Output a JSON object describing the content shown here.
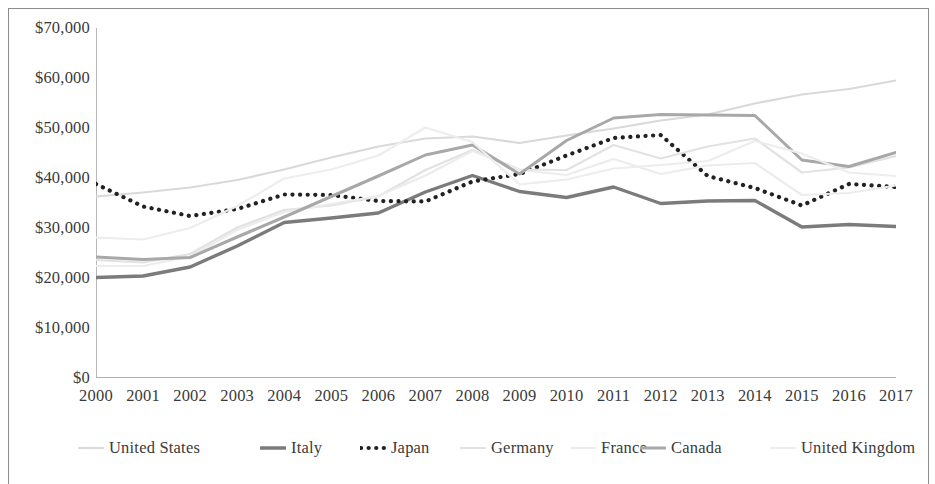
{
  "chart_data": {
    "type": "line",
    "title": "",
    "subtitle": "",
    "xlabel": "",
    "ylabel": "",
    "grid": false,
    "legend_position": "bottom",
    "x": [
      2000,
      2001,
      2002,
      2003,
      2004,
      2005,
      2006,
      2007,
      2008,
      2009,
      2010,
      2011,
      2012,
      2013,
      2014,
      2015,
      2016,
      2017
    ],
    "categories": [
      "2000",
      "2001",
      "2002",
      "2003",
      "2004",
      "2005",
      "2006",
      "2007",
      "2008",
      "2009",
      "2010",
      "2011",
      "2012",
      "2013",
      "2014",
      "2015",
      "2016",
      "2017"
    ],
    "xlim": [
      2000,
      2017
    ],
    "ylim": [
      0,
      70000
    ],
    "ytick_values": [
      0,
      10000,
      20000,
      30000,
      40000,
      50000,
      60000,
      70000
    ],
    "ytick_labels": [
      "$0",
      "$10,000",
      "$20,000",
      "$30,000",
      "$40,000",
      "$50,000",
      "$60,000",
      "$70,000"
    ],
    "series": [
      {
        "name": "United States",
        "color": "#d9d9d9",
        "style": "solid",
        "width": 2.2,
        "values": [
          36300,
          37100,
          38100,
          39600,
          41700,
          44100,
          46300,
          47900,
          48300,
          47000,
          48500,
          49900,
          51500,
          52700,
          54900,
          56700,
          57800,
          59500
        ]
      },
      {
        "name": "Italy",
        "color": "#7b7b7b",
        "style": "solid",
        "width": 3.4,
        "values": [
          20100,
          20400,
          22200,
          26400,
          31100,
          32000,
          33000,
          37200,
          40500,
          37300,
          36100,
          38200,
          34900,
          35400,
          35500,
          30200,
          30700,
          30300
        ]
      },
      {
        "name": "Japan",
        "color": "#222222",
        "style": "dotted",
        "width": 4.2,
        "values": [
          38800,
          34300,
          32400,
          33800,
          36700,
          36600,
          35400,
          35300,
          39300,
          40800,
          44500,
          48000,
          48600,
          40400,
          38000,
          34500,
          38800,
          38200
        ]
      },
      {
        "name": "Germany",
        "color": "#e2e2e2",
        "style": "solid",
        "width": 2.2,
        "values": [
          23600,
          23100,
          24800,
          30100,
          33600,
          34500,
          36300,
          41600,
          45600,
          41700,
          41600,
          46600,
          43900,
          46300,
          47900,
          41100,
          42100,
          44400
        ]
      },
      {
        "name": "France",
        "color": "#ececec",
        "style": "solid",
        "width": 2.2,
        "values": [
          22400,
          22400,
          24300,
          29600,
          33200,
          34800,
          36400,
          40500,
          45400,
          41600,
          40600,
          43800,
          40800,
          42500,
          43000,
          36600,
          37000,
          38500
        ]
      },
      {
        "name": "Canada",
        "color": "#a8a8a8",
        "style": "solid",
        "width": 3.0,
        "values": [
          24200,
          23700,
          24100,
          28200,
          32200,
          36300,
          40400,
          44600,
          46600,
          40800,
          47500,
          52000,
          52700,
          52600,
          52500,
          43600,
          42300,
          45100
        ]
      },
      {
        "name": "United Kingdom",
        "color": "#ededed",
        "style": "solid",
        "width": 2.2,
        "values": [
          28100,
          27700,
          30000,
          34400,
          39900,
          41700,
          44500,
          50100,
          47200,
          38700,
          39700,
          41900,
          42600,
          43400,
          47400,
          44900,
          41100,
          40400
        ]
      }
    ]
  },
  "y_axis": {
    "ticks": [
      {
        "label": "$70,000",
        "value": 70000
      },
      {
        "label": "$60,000",
        "value": 60000
      },
      {
        "label": "$50,000",
        "value": 50000
      },
      {
        "label": "$40,000",
        "value": 40000
      },
      {
        "label": "$30,000",
        "value": 30000
      },
      {
        "label": "$20,000",
        "value": 20000
      },
      {
        "label": "$10,000",
        "value": 10000
      },
      {
        "label": "$0",
        "value": 0
      }
    ]
  },
  "x_axis": {
    "ticks": [
      "2000",
      "2001",
      "2002",
      "2003",
      "2004",
      "2005",
      "2006",
      "2007",
      "2008",
      "2009",
      "2010",
      "2011",
      "2012",
      "2013",
      "2014",
      "2015",
      "2016",
      "2017"
    ]
  },
  "legend": {
    "items": [
      {
        "label": "United States",
        "color": "#d9d9d9",
        "style": "solid"
      },
      {
        "label": "Italy",
        "color": "#7b7b7b",
        "style": "solid"
      },
      {
        "label": "Japan",
        "color": "#222222",
        "style": "dotted"
      },
      {
        "label": "Germany",
        "color": "#e2e2e2",
        "style": "solid"
      },
      {
        "label": "France",
        "color": "#ececec",
        "style": "solid"
      },
      {
        "label": "Canada",
        "color": "#a8a8a8",
        "style": "solid"
      },
      {
        "label": "United Kingdom",
        "color": "#ededed",
        "style": "solid"
      }
    ]
  }
}
